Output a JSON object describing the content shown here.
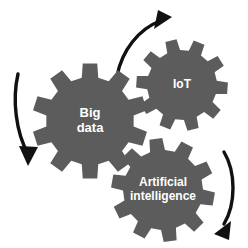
{
  "diagram": {
    "background_color": "#ffffff",
    "gear_color": "#5c5c5c",
    "gear_label_color": "#ffffff",
    "arrow_color": "#111111",
    "gears": [
      {
        "id": "big-data",
        "label_lines": [
          "Big",
          "data"
        ],
        "label_line_1": "Big",
        "label_line_2": "data",
        "cx": 90,
        "cy": 121,
        "outer_radius": 58,
        "inner_radius": 44,
        "teeth": 10,
        "rotation": 18,
        "font_size": 13
      },
      {
        "id": "iot",
        "label_lines": [
          "IoT"
        ],
        "label_line_1": "IoT",
        "label_line_2": "",
        "cx": 182,
        "cy": 85,
        "outer_radius": 46,
        "inner_radius": 35,
        "teeth": 10,
        "rotation": 4,
        "font_size": 12
      },
      {
        "id": "artificial-intelligence",
        "label_lines": [
          "Artificial",
          "intelligence"
        ],
        "label_line_1": "Artificial",
        "label_line_2": "intelligence",
        "cx": 163,
        "cy": 190,
        "outer_radius": 52,
        "inner_radius": 40,
        "teeth": 10,
        "rotation": 10,
        "font_size": 12
      }
    ],
    "arrows": [
      {
        "id": "arrow-left-down",
        "description": "curved arrow on left side pointing downward",
        "path": "M 18 74 C 12 100, 16 132, 28 154",
        "head_points": "28,166 19,146 38,147",
        "head_rotation": 8,
        "stroke_width": 3.4
      },
      {
        "id": "arrow-top-right",
        "description": "curved arrow across the top pointing up to the right",
        "path": "M 117 76 C 122 50, 139 29, 160 21",
        "head_points": "172,17 154,29 158,10",
        "head_rotation": 0,
        "stroke_width": 3.4
      },
      {
        "id": "arrow-right-down",
        "description": "curved arrow on right side pointing down to the left",
        "path": "M 224 152 C 236 172, 236 204, 224 224",
        "head_points": "214,234 231,221 229,240",
        "head_rotation": 0,
        "stroke_width": 3.4
      }
    ]
  }
}
